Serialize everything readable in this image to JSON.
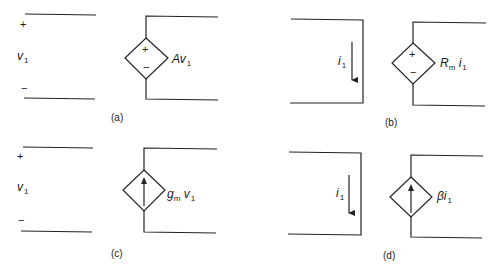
{
  "figure": {
    "panels": [
      {
        "id": "a",
        "caption": "(a)",
        "type": "voltage-controlled voltage source",
        "control": {
          "kind": "voltage",
          "symbol": "v",
          "subscript": "1",
          "plus": "+",
          "minus": "−"
        },
        "source": {
          "shape": "diamond",
          "inner": "plus-minus",
          "plus": "+",
          "minus": "−",
          "label_main": "Av",
          "label_sub": "1"
        }
      },
      {
        "id": "b",
        "caption": "(b)",
        "type": "current-controlled voltage source",
        "control": {
          "kind": "current",
          "symbol": "i",
          "subscript": "1",
          "arrow": "down"
        },
        "source": {
          "shape": "diamond",
          "inner": "plus-minus",
          "plus": "+",
          "minus": "−",
          "label_main": "R",
          "label_main_sub": "m",
          "label_tail": " i",
          "label_sub": "1"
        }
      },
      {
        "id": "c",
        "caption": "(c)",
        "type": "voltage-controlled current source",
        "control": {
          "kind": "voltage",
          "symbol": "v",
          "subscript": "1",
          "plus": "+",
          "minus": "−"
        },
        "source": {
          "shape": "diamond",
          "inner": "arrow-up",
          "label_main": "g",
          "label_main_sub": "m",
          "label_tail": " v",
          "label_sub": "1"
        }
      },
      {
        "id": "d",
        "caption": "(d)",
        "type": "current-controlled current source",
        "control": {
          "kind": "current",
          "symbol": "i",
          "subscript": "1",
          "arrow": "down"
        },
        "source": {
          "shape": "diamond",
          "inner": "arrow-up",
          "label_main": "βi",
          "label_sub": "1"
        }
      }
    ],
    "colors": {
      "line": "#222222",
      "background": "#ffffff"
    }
  }
}
